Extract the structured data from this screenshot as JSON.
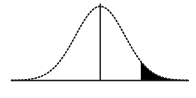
{
  "figure": {
    "width": 196,
    "height": 98,
    "background_color": "#ffffff",
    "ink_color": "#1a1a1a",
    "fill_color": "#000000"
  },
  "chart_data": {
    "type": "line",
    "title": "",
    "subtitle": "",
    "xlabel": "",
    "ylabel": "",
    "grid": false,
    "legend": null,
    "legend_position": "none",
    "annotations": [],
    "xlim": [
      -3.6,
      3.6
    ],
    "ylim": [
      0,
      0.42
    ],
    "curve_style": "dotted",
    "curve_color": "#1a1a1a",
    "baseline": {
      "label": "horizontal-axis",
      "y_value": 0,
      "x_start": -3.6,
      "x_end": 3.6,
      "color": "#1a1a1a"
    },
    "center_line": {
      "label": "mean-vertical-line",
      "x_value": 0,
      "y_from": 0,
      "y_to": 0.4,
      "color": "#1a1a1a"
    },
    "shaded_region": {
      "label": "right-tail-critical-region",
      "x_from": 1.645,
      "x_to": 3.6,
      "fill": "#000000"
    },
    "x": [
      -3.6,
      -3.4,
      -3.2,
      -3.0,
      -2.8,
      -2.6,
      -2.4,
      -2.2,
      -2.0,
      -1.8,
      -1.6,
      -1.4,
      -1.2,
      -1.0,
      -0.8,
      -0.6,
      -0.4,
      -0.2,
      0.0,
      0.2,
      0.4,
      0.6,
      0.8,
      1.0,
      1.2,
      1.4,
      1.6,
      1.8,
      2.0,
      2.2,
      2.4,
      2.6,
      2.8,
      3.0,
      3.2,
      3.4,
      3.6
    ],
    "y": [
      0.0006,
      0.0012,
      0.0024,
      0.0044,
      0.0079,
      0.0136,
      0.0224,
      0.0355,
      0.054,
      0.079,
      0.1109,
      0.1497,
      0.1942,
      0.242,
      0.2897,
      0.3332,
      0.3683,
      0.391,
      0.3989,
      0.391,
      0.3683,
      0.3332,
      0.2897,
      0.242,
      0.1942,
      0.1497,
      0.1109,
      0.079,
      0.054,
      0.0355,
      0.0224,
      0.0136,
      0.0079,
      0.0044,
      0.0024,
      0.0012,
      0.0006
    ],
    "tick_labels": {
      "x": [],
      "y": []
    }
  }
}
